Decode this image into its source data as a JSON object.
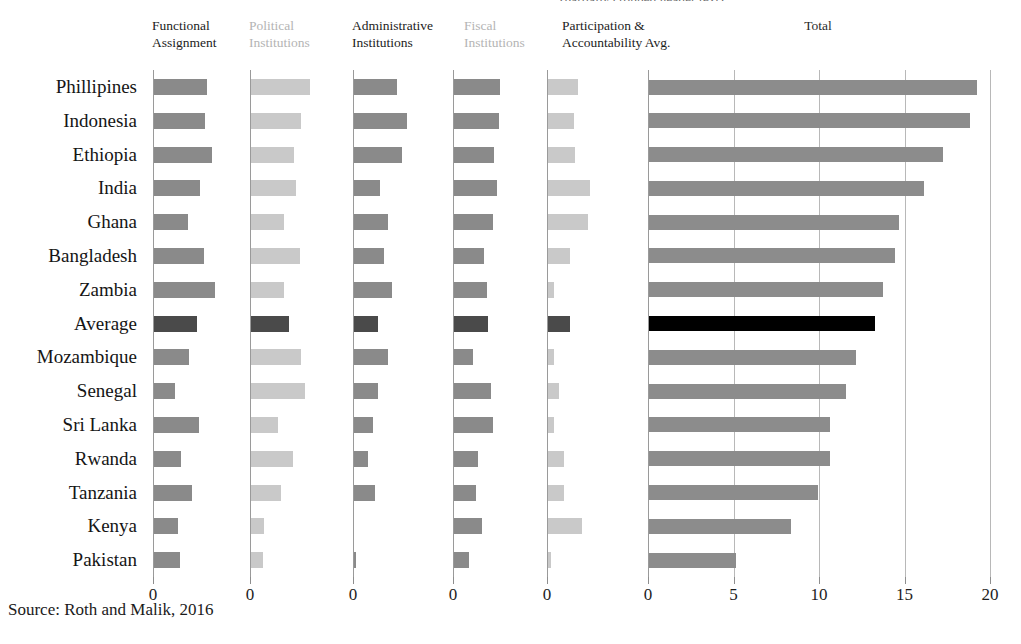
{
  "figure": {
    "clipped_top_note": "(partially cropped header text)",
    "source": "Source: Roth and Malik, 2016"
  },
  "panels": [
    {
      "id": "functional-assignment",
      "label": "Functional\nAssignment",
      "tone": "dark",
      "tick": "0"
    },
    {
      "id": "political-institutions",
      "label": "Political\nInstitutions",
      "tone": "light",
      "tick": "0"
    },
    {
      "id": "administrative-institutions",
      "label": "Administrative\nInstitutions",
      "tone": "dark",
      "tick": "0"
    },
    {
      "id": "fiscal-institutions",
      "label": "Fiscal\nInstitutions",
      "tone": "light",
      "tick": "0"
    },
    {
      "id": "participation-accountability",
      "label": "Participation &\nAccountability Avg.",
      "tone": "dark",
      "tick": "0"
    },
    {
      "id": "total",
      "label": "Total",
      "tone": "total",
      "ticks": [
        "0",
        "5",
        "10",
        "15",
        "20"
      ]
    }
  ],
  "colors": {
    "bar_default": "#8a8a8a",
    "bar_light": "#c9c9c9",
    "bar_total": "#8c8c8c",
    "bar_average": "#4a4a4a",
    "bar_average_total": "#000000",
    "gridline": "#b8b8b8",
    "axis": "#9a9a9a",
    "header_dark": "#1c1c1c",
    "header_light": "#b4b4b4"
  },
  "chart_data": {
    "type": "bar",
    "title": "",
    "orientation": "horizontal",
    "grid": true,
    "legend": false,
    "xlabel": "",
    "ylabel": "",
    "categories": [
      "Phillipines",
      "Indonesia",
      "Ethiopia",
      "India",
      "Ghana",
      "Bangladesh",
      "Zambia",
      "Average",
      "Mozambique",
      "Senegal",
      "Sri Lanka",
      "Rwanda",
      "Tanzania",
      "Kenya",
      "Pakistan"
    ],
    "highlight_category": "Average",
    "panels": [
      {
        "name": "Functional Assignment",
        "xlim": [
          0,
          5.5
        ],
        "tick_labels": [
          "0"
        ],
        "values": [
          3.3,
          3.2,
          3.6,
          2.9,
          2.1,
          3.1,
          3.8,
          2.7,
          2.2,
          1.3,
          2.8,
          1.7,
          2.4,
          1.5,
          1.6
        ]
      },
      {
        "name": "Political Institutions",
        "xlim": [
          0,
          5.5
        ],
        "tick_labels": [
          "0"
        ],
        "values": [
          3.5,
          3.0,
          2.6,
          2.7,
          2.0,
          2.9,
          2.0,
          2.3,
          3.0,
          3.2,
          1.6,
          2.5,
          1.8,
          0.8,
          0.7
        ]
      },
      {
        "name": "Administrative Institutions",
        "xlim": [
          0,
          5.5
        ],
        "tick_labels": [
          "0"
        ],
        "values": [
          2.7,
          3.3,
          3.0,
          1.6,
          2.1,
          1.9,
          2.4,
          1.5,
          2.1,
          1.5,
          1.2,
          0.9,
          1.3,
          0.0,
          0.1
        ]
      },
      {
        "name": "Fiscal Institutions",
        "xlim": [
          0,
          5.5
        ],
        "tick_labels": [
          "0"
        ],
        "values": [
          3.1,
          3.0,
          2.7,
          2.9,
          2.6,
          2.0,
          2.2,
          2.3,
          1.3,
          2.5,
          2.6,
          1.6,
          1.5,
          1.9,
          1.0
        ]
      },
      {
        "name": "Participation & Accountability Avg.",
        "xlim": [
          0,
          5.5
        ],
        "tick_labels": [
          "0"
        ],
        "values": [
          1.9,
          1.6,
          1.7,
          2.6,
          2.5,
          1.4,
          0.4,
          1.4,
          0.4,
          0.7,
          0.4,
          1.0,
          1.0,
          2.1,
          0.2
        ]
      },
      {
        "name": "Total",
        "xlim": [
          0,
          20
        ],
        "tick_labels": [
          "0",
          "5",
          "10",
          "15",
          "20"
        ],
        "values": [
          19.2,
          18.8,
          17.2,
          16.1,
          14.6,
          14.4,
          13.7,
          13.2,
          12.1,
          11.5,
          10.6,
          10.6,
          9.9,
          8.3,
          5.1
        ]
      }
    ]
  }
}
